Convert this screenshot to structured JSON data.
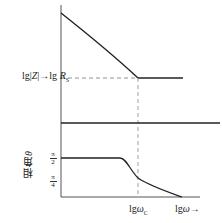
{
  "diagram": {
    "type": "impedance-phase frequency response sketch",
    "magnitude_axis_label": "lg|Z|→lg R_S",
    "magnitude_label_parts": {
      "lg1": "lg|",
      "Z": "Z",
      "arrow": "|→lg ",
      "R": "R",
      "sub": "S"
    },
    "phase_axis_label": {
      "text": "相角",
      "symbol": "θ"
    },
    "phase_ticks": [
      {
        "label_num": "π",
        "label_den": "2",
        "y": 158
      },
      {
        "label_num": "π",
        "label_den": "4",
        "y": 180
      }
    ],
    "x_ticks": [
      {
        "prefix": "lg",
        "symbol": "ω",
        "sub": "C"
      },
      {
        "prefix": "lg",
        "symbol": "ω",
        "suffix": "→"
      }
    ],
    "colors": {
      "line": "#222222",
      "dashed": "#777777",
      "axis": "#555555"
    }
  }
}
